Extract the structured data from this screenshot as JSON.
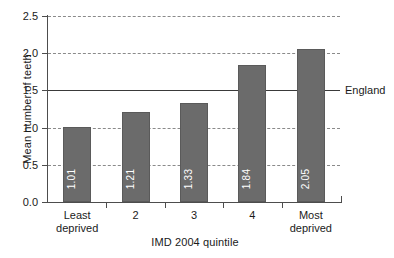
{
  "chart_data": {
    "type": "bar",
    "title": "",
    "subtitle": "",
    "xlabel": "IMD 2004 quintile",
    "ylabel": "Mean number of teeth",
    "categories": [
      "Least deprived",
      "2",
      "3",
      "4",
      "Most deprived"
    ],
    "values": [
      1.01,
      1.21,
      1.33,
      1.84,
      2.05
    ],
    "value_labels": [
      "1.01",
      "1.21",
      "1.33",
      "1.84",
      "2.05"
    ],
    "ylim": [
      0.0,
      2.5
    ],
    "ytick_labels": [
      "0.0",
      "0.5",
      "1.0",
      "1.5",
      "2.0",
      "2.5"
    ],
    "ytick_values": [
      0.0,
      0.5,
      1.0,
      1.5,
      2.0,
      2.5
    ],
    "grid": "horizontal-dashed",
    "legend": "none",
    "annotations": [
      {
        "name": "england-reference-line",
        "label": "England",
        "value": 1.5,
        "style": "solid"
      }
    ],
    "colors": {
      "bar_fill": "#6b6b6b",
      "bar_stroke": "#5a5a5a",
      "value_label": "#ffffff",
      "gridline": "#8a8a8a",
      "reference_line": "#3a3a3a",
      "axis": "#4d4d4d",
      "text": "#1a1a1a",
      "background": "#ffffff"
    }
  }
}
